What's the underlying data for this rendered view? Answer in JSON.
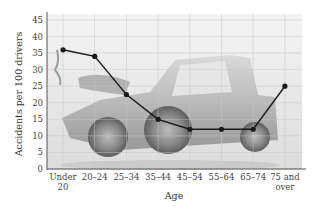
{
  "chart_data": {
    "type": "line",
    "title": "",
    "xlabel": "Age",
    "ylabel": "Accidents per 100 drivers",
    "categories": [
      [
        "Under",
        "20"
      ],
      [
        "20–24"
      ],
      [
        "25–34"
      ],
      [
        "35–44"
      ],
      [
        "45–54"
      ],
      [
        "55–64"
      ],
      [
        "65–74"
      ],
      [
        "75 and",
        "over"
      ]
    ],
    "series": [
      {
        "name": "Accidents per 100 drivers",
        "values": [
          36,
          34,
          22.5,
          15,
          12,
          12,
          12,
          25
        ]
      }
    ],
    "ylim": [
      0,
      45
    ],
    "yticks": [
      0,
      5,
      10,
      15,
      20,
      25,
      30,
      35,
      40,
      45
    ],
    "grid": true,
    "background_image": "pickup-truck-crash-photo",
    "colors": {
      "line": "#1a1a1a",
      "grid": "#c8c8c8",
      "axis": "#555555"
    }
  }
}
